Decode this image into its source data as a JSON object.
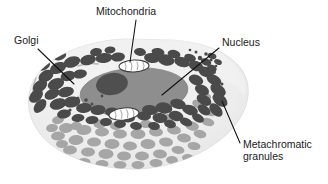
{
  "figure": {
    "background_color": "#ffffff"
  },
  "colors": {
    "cell_body": "#eeeeee",
    "cell_body_edge": "#e2e2e2",
    "cell_body_shadow": "#e6e6e6",
    "nucleus": "#8e8e8e",
    "nucleolus": "#4f4f4f",
    "granule_dark": "#4a4a4a",
    "granule_light": "#a6a6a6",
    "mitochondria_fill": "#ffffff",
    "mitochondria_stroke": "#3a3a3a",
    "golgi_stroke": "#b9b9b9",
    "leader_line": "#111111",
    "label_text": "#1a1a1a"
  },
  "labels": [
    {
      "id": "golgi",
      "text": "Golgi",
      "x": 14,
      "y": 44,
      "anchor": "start"
    },
    {
      "id": "mitochondria",
      "text": "Mitochondria",
      "x": 96,
      "y": 15,
      "anchor": "start"
    },
    {
      "id": "nucleus",
      "text": "Nucleus",
      "x": 222,
      "y": 46,
      "anchor": "start"
    },
    {
      "id": "metachromatic-granules-line1",
      "text": "Metachromatic",
      "x": 243,
      "y": 148,
      "anchor": "start"
    },
    {
      "id": "metachromatic-granules-line2",
      "text": "granules",
      "x": 243,
      "y": 160,
      "anchor": "start"
    }
  ],
  "leader_lines": [
    {
      "id": "golgi-leader",
      "x1": 38,
      "y1": 49,
      "x2": 74,
      "y2": 84
    },
    {
      "id": "mitochondria-leader",
      "x1": 136,
      "y1": 20,
      "x2": 130,
      "y2": 62
    },
    {
      "id": "nucleus-leader",
      "x1": 219,
      "y1": 48,
      "x2": 162,
      "y2": 95
    },
    {
      "id": "metachromatic-leader",
      "x1": 240,
      "y1": 143,
      "x2": 222,
      "y2": 101
    }
  ],
  "structures": {
    "nucleus": {
      "cx": 134,
      "cy": 92,
      "rx": 54,
      "ry": 24,
      "rotation": -4
    },
    "nucleolus": {
      "cx": 112,
      "cy": 84,
      "rx": 16,
      "ry": 11,
      "rotation": -10
    },
    "mitochondria": [
      {
        "id": "mito-top",
        "cx": 134,
        "cy": 66,
        "rx": 15,
        "ry": 6,
        "rotation": -2
      },
      {
        "id": "mito-bottom",
        "cx": 124,
        "cy": 114,
        "rx": 15,
        "ry": 6,
        "rotation": -6
      }
    ],
    "golgi": [
      {
        "id": "golgi-arc-1",
        "d": "M 36 78 Q 30 90 36 102"
      },
      {
        "id": "golgi-arc-2",
        "d": "M 41 76 Q 35 89 41 101"
      },
      {
        "id": "golgi-arc-3",
        "d": "M 78 66 Q 88 62 98 64"
      }
    ]
  },
  "chart_data": {
    "type": "scatter",
    "granule_count_dark": 62,
    "granule_count_light": 44,
    "granules_dark": [
      [
        72,
        62,
        8.5,
        5.5,
        -18
      ],
      [
        88,
        60,
        8,
        5,
        -12
      ],
      [
        104,
        58,
        8.5,
        5,
        -8
      ],
      [
        118,
        57,
        7,
        4.5,
        -6
      ],
      [
        152,
        58,
        8,
        5,
        8
      ],
      [
        166,
        60,
        8.5,
        5.5,
        12
      ],
      [
        182,
        62,
        8,
        5,
        16
      ],
      [
        196,
        66,
        7.5,
        5,
        20
      ],
      [
        58,
        68,
        8.5,
        5.5,
        -24
      ],
      [
        46,
        76,
        8,
        5.5,
        -30
      ],
      [
        40,
        86,
        8,
        5.5,
        -38
      ],
      [
        36,
        96,
        8,
        5.5,
        -44
      ],
      [
        40,
        106,
        8,
        5,
        -50
      ],
      [
        206,
        72,
        8,
        5,
        24
      ],
      [
        214,
        80,
        8,
        5,
        30
      ],
      [
        218,
        90,
        8.5,
        5.5,
        34
      ],
      [
        220,
        100,
        8.5,
        5.5,
        40
      ],
      [
        216,
        110,
        8,
        5,
        46
      ],
      [
        56,
        84,
        8.5,
        5.5,
        -20
      ],
      [
        52,
        94,
        8,
        5,
        -26
      ],
      [
        58,
        104,
        8.5,
        5.5,
        -16
      ],
      [
        68,
        76,
        7.5,
        5,
        -14
      ],
      [
        80,
        74,
        7,
        4.5,
        -10
      ],
      [
        196,
        80,
        7.5,
        5,
        22
      ],
      [
        202,
        90,
        7.5,
        5,
        26
      ],
      [
        204,
        100,
        8,
        5,
        30
      ],
      [
        66,
        92,
        8,
        5,
        -12
      ],
      [
        72,
        102,
        8.5,
        5.5,
        -8
      ],
      [
        84,
        108,
        8,
        5,
        -6
      ],
      [
        98,
        110,
        7.5,
        5,
        -4
      ],
      [
        112,
        112,
        7,
        4.5,
        0
      ],
      [
        150,
        110,
        8,
        5,
        6
      ],
      [
        164,
        108,
        8.5,
        5.5,
        10
      ],
      [
        178,
        104,
        8,
        5,
        14
      ],
      [
        190,
        110,
        8,
        5,
        18
      ],
      [
        176,
        116,
        7.5,
        5,
        12
      ],
      [
        160,
        118,
        7.5,
        5,
        8
      ],
      [
        144,
        116,
        7,
        4.5,
        4
      ],
      [
        128,
        118,
        7,
        4.5,
        2
      ],
      [
        60,
        56,
        6.5,
        4,
        -22
      ],
      [
        96,
        52,
        6,
        4,
        -10
      ],
      [
        110,
        50,
        5.5,
        3.5,
        -8
      ],
      [
        140,
        52,
        6,
        4,
        6
      ],
      [
        158,
        52,
        6.5,
        4,
        10
      ],
      [
        174,
        54,
        6.5,
        4,
        14
      ],
      [
        190,
        58,
        6,
        4,
        18
      ],
      [
        44,
        66,
        6.5,
        4,
        -28
      ],
      [
        206,
        62,
        5.5,
        3.5,
        22
      ],
      [
        212,
        68,
        5,
        3.2,
        26
      ],
      [
        64,
        114,
        7,
        4.5,
        -10
      ],
      [
        78,
        118,
        6.5,
        4,
        -6
      ],
      [
        92,
        120,
        6.5,
        4,
        -4
      ],
      [
        106,
        122,
        6,
        4,
        -2
      ],
      [
        120,
        124,
        6,
        4,
        0
      ],
      [
        204,
        110,
        7,
        4.5,
        34
      ],
      [
        198,
        118,
        6.5,
        4,
        30
      ],
      [
        186,
        122,
        6.5,
        4,
        20
      ],
      [
        170,
        124,
        6,
        4,
        14
      ],
      [
        154,
        126,
        6,
        4,
        10
      ],
      [
        136,
        126,
        6,
        4,
        6
      ],
      [
        212,
        56,
        4.5,
        3,
        20
      ],
      [
        218,
        62,
        4,
        2.6,
        24
      ]
    ],
    "granules_light": [
      [
        66,
        128,
        7,
        5,
        -6
      ],
      [
        84,
        130,
        7.5,
        5,
        -4
      ],
      [
        102,
        132,
        7,
        4.5,
        -2
      ],
      [
        120,
        134,
        7,
        4.5,
        0
      ],
      [
        138,
        134,
        7.5,
        5,
        2
      ],
      [
        156,
        132,
        7,
        4.5,
        4
      ],
      [
        174,
        130,
        7,
        4.5,
        8
      ],
      [
        192,
        126,
        7,
        4.5,
        12
      ],
      [
        208,
        122,
        6.5,
        4,
        16
      ],
      [
        58,
        136,
        7,
        4.5,
        -4
      ],
      [
        76,
        140,
        7.5,
        5,
        -2
      ],
      [
        94,
        142,
        7,
        4.5,
        0
      ],
      [
        112,
        144,
        7.5,
        5,
        0
      ],
      [
        130,
        146,
        7,
        4.5,
        2
      ],
      [
        148,
        144,
        7.5,
        5,
        2
      ],
      [
        166,
        142,
        7,
        4.5,
        6
      ],
      [
        184,
        138,
        7,
        4.5,
        8
      ],
      [
        200,
        134,
        6.5,
        4,
        12
      ],
      [
        70,
        150,
        7,
        4.5,
        -2
      ],
      [
        88,
        152,
        7,
        4.5,
        0
      ],
      [
        106,
        154,
        7.5,
        5,
        0
      ],
      [
        124,
        156,
        7,
        4.5,
        0
      ],
      [
        142,
        156,
        7,
        4.5,
        2
      ],
      [
        160,
        154,
        7,
        4.5,
        4
      ],
      [
        178,
        150,
        6.5,
        4,
        6
      ],
      [
        194,
        146,
        6.5,
        4,
        8
      ],
      [
        84,
        162,
        6.5,
        4,
        0
      ],
      [
        102,
        164,
        6.5,
        4,
        0
      ],
      [
        120,
        165,
        6.5,
        4,
        0
      ],
      [
        138,
        165,
        6.5,
        4,
        0
      ],
      [
        156,
        163,
        6.5,
        4,
        2
      ],
      [
        172,
        160,
        6,
        4,
        4
      ],
      [
        52,
        128,
        6,
        4,
        -8
      ],
      [
        210,
        112,
        6,
        4,
        18
      ],
      [
        62,
        144,
        6,
        4,
        -2
      ],
      [
        188,
        158,
        6,
        4,
        6
      ],
      [
        100,
        124,
        6.5,
        4.5,
        -2
      ],
      [
        116,
        126,
        6,
        4,
        0
      ],
      [
        146,
        124,
        6,
        4,
        2
      ],
      [
        168,
        118,
        6,
        4,
        8
      ],
      [
        198,
        104,
        6,
        4,
        22
      ],
      [
        206,
        96,
        5.5,
        3.5,
        26
      ],
      [
        58,
        120,
        6,
        4,
        -10
      ],
      [
        76,
        126,
        6,
        4,
        -6
      ]
    ],
    "small_dots": [
      [
        200,
        58,
        2.2
      ],
      [
        206,
        54,
        1.8
      ],
      [
        211,
        60,
        1.6
      ],
      [
        196,
        52,
        1.5
      ],
      [
        214,
        72,
        2.0
      ],
      [
        208,
        68,
        1.6
      ],
      [
        202,
        74,
        1.4
      ],
      [
        86,
        100,
        1.8
      ],
      [
        92,
        104,
        1.5
      ],
      [
        78,
        98,
        1.5
      ],
      [
        102,
        96,
        1.4
      ],
      [
        216,
        66,
        1.3
      ],
      [
        190,
        50,
        1.3
      ],
      [
        70,
        110,
        1.6
      ],
      [
        60,
        100,
        1.4
      ],
      [
        222,
        84,
        1.5
      ],
      [
        224,
        92,
        1.4
      ]
    ]
  }
}
